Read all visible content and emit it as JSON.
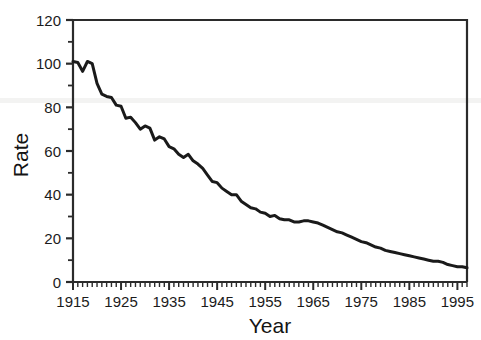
{
  "chart_data": {
    "type": "line",
    "title": "",
    "xlabel": "Year",
    "ylabel": "Rate",
    "xlim": [
      1915,
      1997
    ],
    "ylim": [
      0,
      120
    ],
    "grid": false,
    "legend": null,
    "x_ticks": [
      1915,
      1925,
      1935,
      1945,
      1955,
      1965,
      1975,
      1985,
      1995
    ],
    "x_tick_labels": [
      "1915",
      "1925",
      "1935",
      "1945",
      "1955",
      "1965",
      "1975",
      "1985",
      "1995"
    ],
    "x_minor_tick_step": 1,
    "y_ticks": [
      0,
      20,
      40,
      60,
      80,
      100,
      120
    ],
    "y_tick_labels": [
      "0",
      "20",
      "40",
      "60",
      "80",
      "100",
      "120"
    ],
    "y_minor_tick_step": 10,
    "line_color": "#1a1a1a",
    "line_width": 3,
    "series": [
      {
        "name": "Rate",
        "x": [
          1915,
          1916,
          1917,
          1918,
          1919,
          1920,
          1921,
          1922,
          1923,
          1924,
          1925,
          1926,
          1927,
          1928,
          1929,
          1930,
          1931,
          1932,
          1933,
          1934,
          1935,
          1936,
          1937,
          1938,
          1939,
          1940,
          1941,
          1942,
          1943,
          1944,
          1945,
          1946,
          1947,
          1948,
          1949,
          1950,
          1951,
          1952,
          1953,
          1954,
          1955,
          1956,
          1957,
          1958,
          1959,
          1960,
          1961,
          1962,
          1963,
          1964,
          1965,
          1966,
          1967,
          1968,
          1969,
          1970,
          1971,
          1972,
          1973,
          1974,
          1975,
          1976,
          1977,
          1978,
          1979,
          1980,
          1981,
          1982,
          1983,
          1984,
          1985,
          1986,
          1987,
          1988,
          1989,
          1990,
          1991,
          1992,
          1993,
          1994,
          1995,
          1996,
          1997
        ],
        "y": [
          101,
          100.5,
          96.5,
          101,
          100,
          91,
          86,
          85,
          84.5,
          81,
          80.5,
          75,
          75.5,
          73,
          70,
          71.5,
          70.5,
          65,
          66.5,
          65.5,
          62,
          61,
          58.5,
          57,
          58.5,
          55.5,
          54,
          52,
          49,
          46,
          45.5,
          43,
          41.5,
          40,
          40,
          37,
          35.5,
          34,
          33.5,
          32,
          31.5,
          30,
          30.5,
          29,
          28.5,
          28.5,
          27.5,
          27.5,
          28,
          28,
          27.5,
          27,
          26,
          25,
          24,
          23,
          22.5,
          21.5,
          20.5,
          19.5,
          18.5,
          18,
          17,
          16,
          15.5,
          14.5,
          14,
          13.5,
          13,
          12.5,
          12,
          11.5,
          11,
          10.5,
          10,
          9.5,
          9.5,
          9,
          8,
          7.5,
          7,
          7,
          6.5
        ]
      }
    ]
  },
  "axes": {
    "y_axis_label": "Rate",
    "x_axis_label": "Year"
  }
}
